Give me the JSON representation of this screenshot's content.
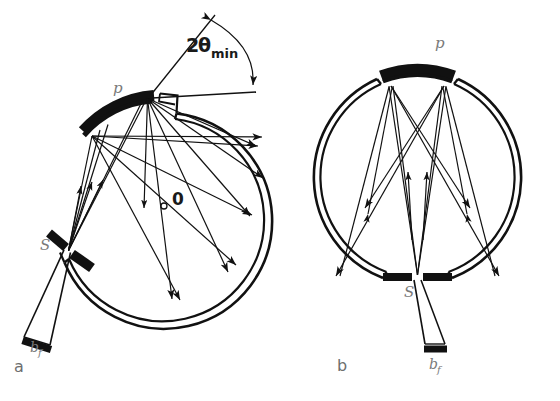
{
  "figure": {
    "type": "optical-ray-diagram",
    "background_color": "#ffffff",
    "line_color": "#111111",
    "label_color": "#7a7a7a"
  },
  "panels": [
    {
      "id": "a",
      "panel_label": "a",
      "label_x": 14,
      "label_y": 372,
      "circle": {
        "cx": 170,
        "cy": 213,
        "r": 104
      },
      "labels": {
        "crystal": "p",
        "crystal_x": 113,
        "crystal_y": 93,
        "source": "S",
        "source_x": 40,
        "source_y": 250,
        "beam": "b",
        "beam_sub": "f",
        "beam_x": 30,
        "beam_y": 352,
        "center": "0",
        "center_x": 172,
        "center_y": 205,
        "angle": "2",
        "angle_theta": "θ",
        "angle_sub": "min",
        "angle_x": 186,
        "angle_y": 52
      }
    },
    {
      "id": "b",
      "panel_label": "b",
      "label_x": 337,
      "label_y": 371,
      "circle": {
        "cx": 417,
        "cy": 176,
        "r": 104
      },
      "labels": {
        "crystal": "p",
        "crystal_x": 435,
        "crystal_y": 48,
        "source": "S",
        "source_x": 404,
        "source_y": 297,
        "beam": "b",
        "beam_sub": "f",
        "beam_x": 429,
        "beam_y": 369
      }
    }
  ],
  "annotations": {
    "angle_label_full": "2θmin",
    "center_marker": "0",
    "source_marker": "S",
    "crystal_marker": "p",
    "beam_stop_marker": "bf"
  }
}
